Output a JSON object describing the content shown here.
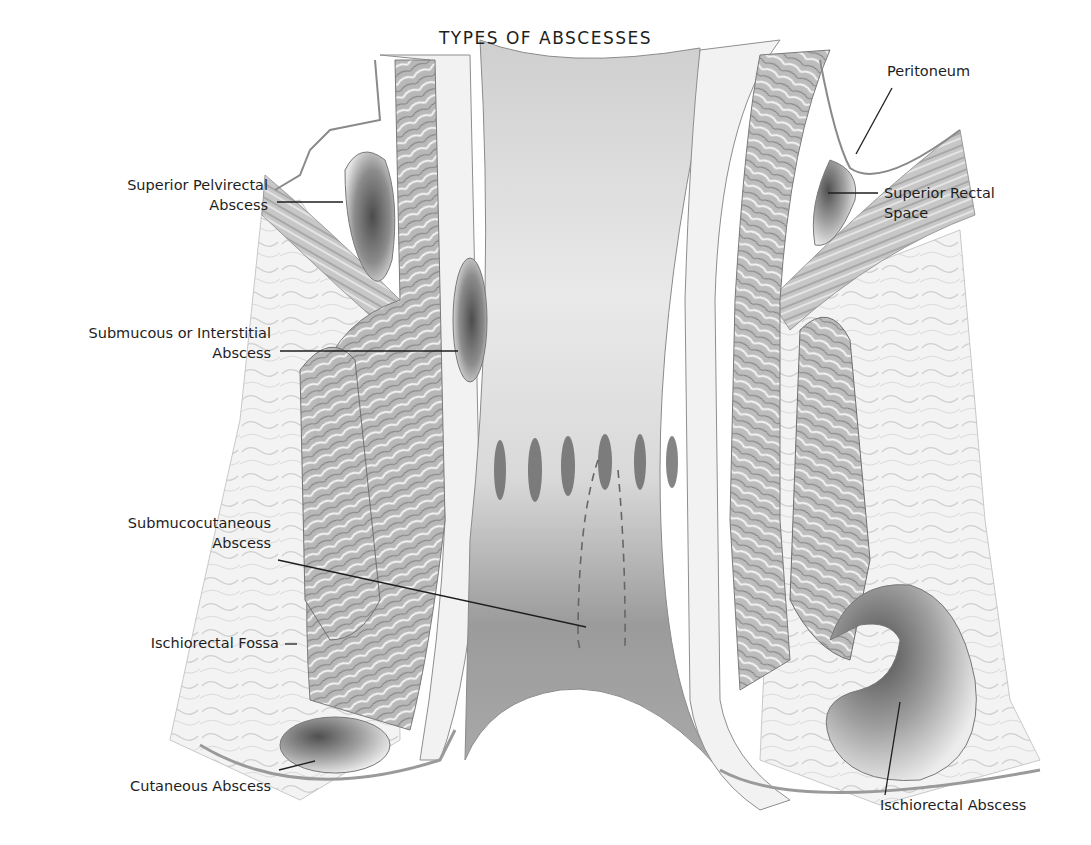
{
  "figure": {
    "title": "TYPES OF ABSCESSES",
    "labels": {
      "superior_pelvirectal": {
        "line1": "Superior Pelvirectal",
        "line2": "Abscess"
      },
      "submucous_interstitial": {
        "line1": "Submucous or Interstitial",
        "line2": "Abscess"
      },
      "submucocutaneous": {
        "line1": "Submucocutaneous",
        "line2": "Abscess"
      },
      "ischiorectal_fossa": {
        "line1": "Ischiorectal Fossa"
      },
      "cutaneous": {
        "line1": "Cutaneous Abscess"
      },
      "peritoneum": {
        "line1": "Peritoneum"
      },
      "superior_rectal_space": {
        "line1": "Superior Rectal",
        "line2": "Space"
      },
      "ischiorectal_abscess": {
        "line1": "Ischiorectal Abscess"
      }
    },
    "colors": {
      "ink": "#1e1e1e",
      "tissue_light": "#efefef",
      "tissue_mid": "#bdbdbd",
      "tissue_dark": "#6e6e6e",
      "background": "#ffffff"
    }
  }
}
